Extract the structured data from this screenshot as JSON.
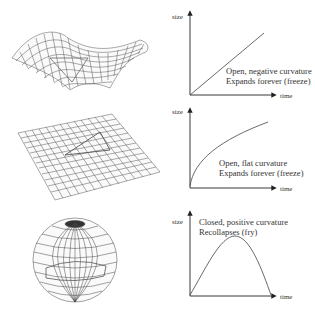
{
  "panels": [
    {
      "shape": "saddle-surface",
      "graph": {
        "y_label": "size",
        "x_label": "time",
        "caption_line1": "Open, negative curvature",
        "caption_line2": "Expands forever (freeze)",
        "curve": "linear"
      }
    },
    {
      "shape": "flat-plane",
      "graph": {
        "y_label": "size",
        "x_label": "time",
        "caption_line1": "Open, flat curvature",
        "caption_line2": "Expands forever (freeze)",
        "curve": "concave-increasing"
      }
    },
    {
      "shape": "sphere",
      "graph": {
        "y_label": "size",
        "x_label": "time",
        "caption_line1": "Closed, positive curvature",
        "caption_line2": "Recollapses (fry)",
        "curve": "arch"
      }
    }
  ]
}
